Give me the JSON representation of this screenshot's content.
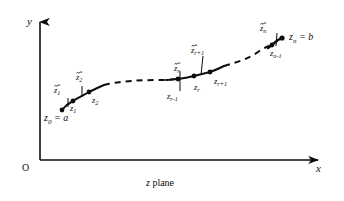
{
  "figure": {
    "caption": "z plane",
    "caption_italic_part": "z",
    "caption_rest": " plane",
    "background_color": "#ffffff",
    "ink_color": "#0d0d0d"
  },
  "axes": {
    "y_label": "y",
    "x_label": "x",
    "origin_label": "O",
    "y_axis_name": "vertical-axis",
    "x_axis_name": "horizontal-axis"
  },
  "curve": {
    "description": "partitioned contour from a to b",
    "segments": [
      {
        "style": "solid",
        "from": "z0",
        "to": "z2"
      },
      {
        "style": "dashed",
        "from": "z2",
        "to": "zr-1"
      },
      {
        "style": "solid",
        "from": "zr-1",
        "to": "zr+1"
      },
      {
        "style": "dashed",
        "from": "zr+1",
        "to": "zn-1"
      },
      {
        "style": "solid",
        "from": "zn-1",
        "to": "zn"
      }
    ]
  },
  "points": [
    {
      "id": "z0",
      "label": "z",
      "sub": "0",
      "x": 62,
      "y": 110,
      "dot": true
    },
    {
      "id": "z1",
      "label": "z",
      "sub": "1",
      "x": 73,
      "y": 101,
      "dot": true
    },
    {
      "id": "z2",
      "label": "z",
      "sub": "2",
      "x": 89,
      "y": 92,
      "dot": true
    },
    {
      "id": "zr-1",
      "label": "z",
      "sub": "r-1",
      "x": 178,
      "y": 79,
      "dot": true
    },
    {
      "id": "zr",
      "label": "z",
      "sub": "r",
      "x": 194,
      "y": 76,
      "dot": true
    },
    {
      "id": "zr+1",
      "label": "z",
      "sub": "r+1",
      "x": 210,
      "y": 72,
      "dot": true
    },
    {
      "id": "zn-1",
      "label": "z",
      "sub": "n-1",
      "x": 272,
      "y": 45,
      "dot": true
    },
    {
      "id": "zn",
      "label": "z",
      "sub": "n",
      "x": 282,
      "y": 38,
      "dot": true
    }
  ],
  "point_labels": [
    {
      "name": "label-z0-equals-a",
      "text_z": "z",
      "sub": "0",
      "eq": " = a",
      "x": 45,
      "y": 113
    },
    {
      "name": "label-z1",
      "text_z": "z",
      "sub": "1",
      "x": 70,
      "y": 106
    },
    {
      "name": "label-z2",
      "text_z": "z",
      "sub": "2",
      "x": 92,
      "y": 98
    },
    {
      "name": "label-zr-1",
      "text_z": "z",
      "sub": "r-1",
      "x": 168,
      "y": 93
    },
    {
      "name": "label-zr",
      "text_z": "z",
      "sub": "r",
      "x": 196,
      "y": 84
    },
    {
      "name": "label-zr+1",
      "text_z": "z",
      "sub": "r+1",
      "x": 215,
      "y": 78
    },
    {
      "name": "label-zn-1",
      "text_z": "z",
      "sub": "n-1",
      "x": 270,
      "y": 50
    },
    {
      "name": "label-zn-equals-b",
      "text_z": "z",
      "sub": "n",
      "eq": " = b",
      "x": 289,
      "y": 34
    }
  ],
  "tilde_labels": [
    {
      "name": "label-ztilde-1",
      "text_z": "z",
      "sub": "1",
      "x": 55,
      "y": 89
    },
    {
      "name": "label-ztilde-2",
      "text_z": "z",
      "sub": "2",
      "x": 77,
      "y": 76
    },
    {
      "name": "label-ztilde-r",
      "text_z": "z",
      "sub": "r",
      "x": 174,
      "y": 67
    },
    {
      "name": "label-ztilde-r+1",
      "text_z": "z",
      "sub": "r+1",
      "x": 192,
      "y": 49
    },
    {
      "name": "label-ztilde-n",
      "text_z": "z",
      "sub": "n",
      "x": 261,
      "y": 27
    }
  ],
  "tick_marks": [
    {
      "name": "tick-ztilde-1",
      "x": 68,
      "y1": 98,
      "y2": 106
    },
    {
      "name": "tick-ztilde-2",
      "x": 82,
      "y1": 86,
      "y2": 96
    },
    {
      "name": "tick-ztilde-r",
      "x": 180,
      "y1": 72,
      "y2": 90
    },
    {
      "name": "tick-ztilde-r+1",
      "x": 202,
      "y1": 56,
      "y2": 74
    },
    {
      "name": "tick-ztilde-n",
      "x": 277,
      "y1": 33,
      "y2": 45
    }
  ]
}
